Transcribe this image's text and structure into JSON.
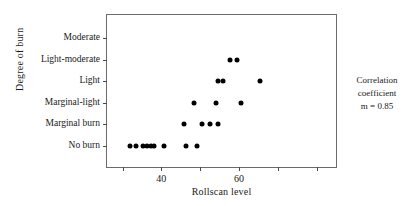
{
  "chart_data": {
    "type": "scatter",
    "title": "",
    "xlabel": "Rollscan level",
    "ylabel": "Degree of burn",
    "xlim": [
      26,
      85
    ],
    "ylim_categories": [
      "No burn",
      "Marginal burn",
      "Marginal-light",
      "Light",
      "Light-moderate",
      "Moderate"
    ],
    "x_ticks": [
      30,
      40,
      50,
      60,
      70,
      80
    ],
    "x_tick_labels": [
      "",
      "40",
      "",
      "60",
      "",
      ""
    ],
    "y_tick_labels": [
      "Moderate",
      "Light-moderate",
      "Light",
      "Marginal-light",
      "Marginal burn",
      "No burn"
    ],
    "grid": false,
    "legend": null,
    "annotations": [
      "Correlation",
      "coefficient",
      "m = 0.85"
    ],
    "correlation_coefficient": 0.85,
    "marker_color": "#000000",
    "frame_color": "#6b6b6b",
    "points": [
      {
        "x": 32.0,
        "category": "No burn"
      },
      {
        "x": 33.5,
        "category": "No burn"
      },
      {
        "x": 35.2,
        "category": "No burn"
      },
      {
        "x": 36.4,
        "category": "No burn"
      },
      {
        "x": 37.3,
        "category": "No burn"
      },
      {
        "x": 38.2,
        "category": "No burn"
      },
      {
        "x": 40.8,
        "category": "No burn"
      },
      {
        "x": 46.4,
        "category": "No burn"
      },
      {
        "x": 49.2,
        "category": "No burn"
      },
      {
        "x": 45.8,
        "category": "Marginal burn"
      },
      {
        "x": 50.6,
        "category": "Marginal burn"
      },
      {
        "x": 52.6,
        "category": "Marginal burn"
      },
      {
        "x": 54.6,
        "category": "Marginal burn"
      },
      {
        "x": 48.5,
        "category": "Marginal-light"
      },
      {
        "x": 54.0,
        "category": "Marginal-light"
      },
      {
        "x": 60.6,
        "category": "Marginal-light"
      },
      {
        "x": 54.6,
        "category": "Light"
      },
      {
        "x": 56.0,
        "category": "Light"
      },
      {
        "x": 65.5,
        "category": "Light"
      },
      {
        "x": 57.6,
        "category": "Light-moderate"
      },
      {
        "x": 59.6,
        "category": "Light-moderate"
      }
    ]
  }
}
